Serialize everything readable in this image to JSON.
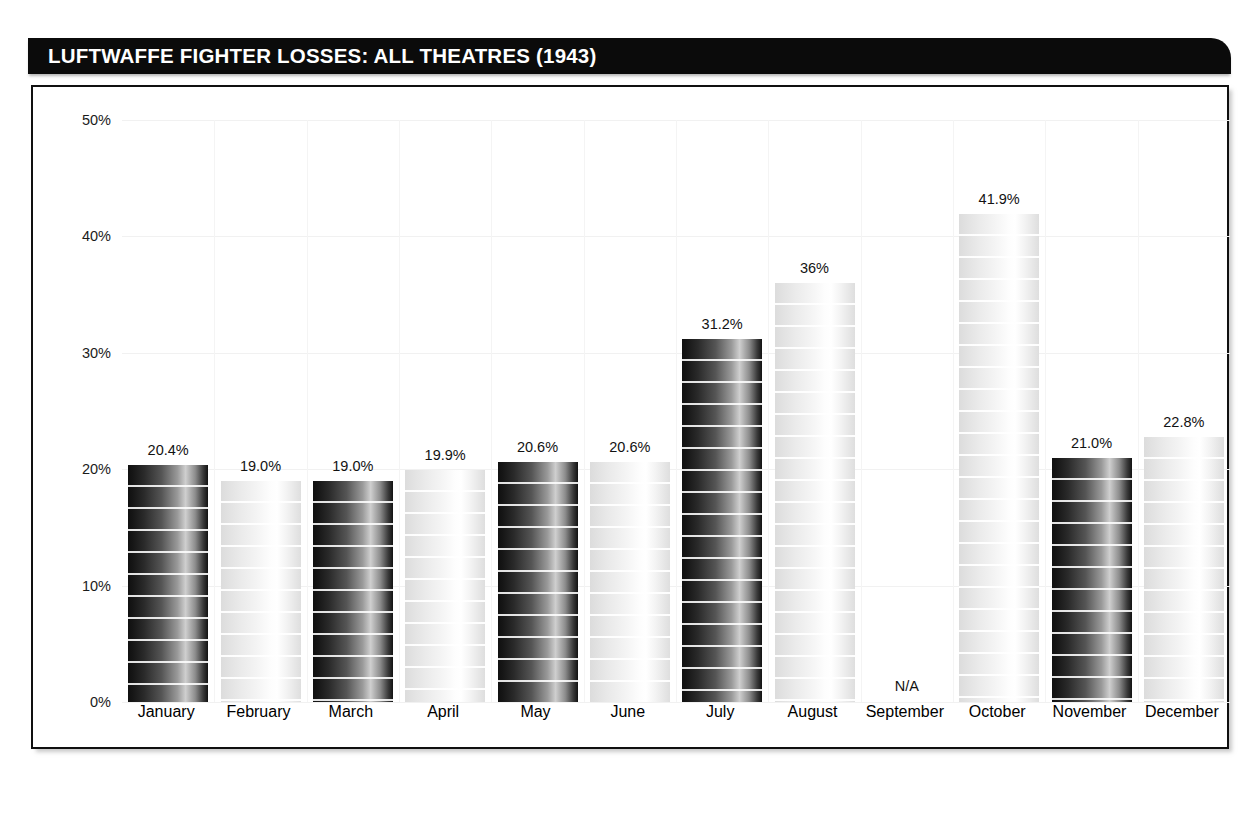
{
  "header": {
    "title": "LUFTWAFFE FIGHTER LOSSES: ALL THEATRES (1943)",
    "bar_color": "#0b0b0b",
    "text_color": "#ffffff"
  },
  "chart_data": {
    "type": "bar",
    "title": "LUFTWAFFE FIGHTER LOSSES: ALL THEATRES (1943)",
    "xlabel": "",
    "ylabel": "",
    "ylim": [
      0,
      50
    ],
    "yticks": [
      0,
      10,
      20,
      30,
      40,
      50
    ],
    "ytick_labels": [
      "0%",
      "10%",
      "20%",
      "30%",
      "40%",
      "50%"
    ],
    "grid": true,
    "legend": false,
    "categories": [
      "January",
      "February",
      "March",
      "April",
      "May",
      "June",
      "July",
      "August",
      "September",
      "October",
      "November",
      "December"
    ],
    "values": [
      20.4,
      19.0,
      19.0,
      19.9,
      20.6,
      20.6,
      31.2,
      36,
      null,
      41.9,
      21.0,
      22.8
    ],
    "value_labels": [
      "20.4%",
      "19.0%",
      "19.0%",
      "19.9%",
      "20.6%",
      "20.6%",
      "31.2%",
      "36%",
      "N/A",
      "41.9%",
      "21.0%",
      "22.8%"
    ],
    "bar_styles": [
      "dark",
      "light",
      "dark",
      "light",
      "dark",
      "light",
      "dark",
      "light",
      "none",
      "light",
      "dark",
      "light"
    ],
    "missing_label": "N/A",
    "missing_category": "September",
    "colors": {
      "bar_dark": "#1a1a1a",
      "bar_light": "#ededed",
      "axis": "#101010",
      "gridline": "#f1f1f1",
      "text": "#121212"
    }
  }
}
